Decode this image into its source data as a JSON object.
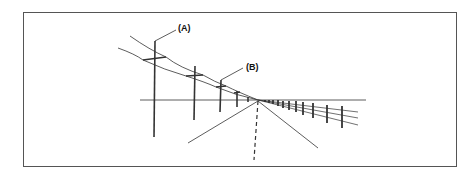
{
  "figure": {
    "labels": {
      "a": "(A)",
      "b": "(B)"
    },
    "colors": {
      "line": "#333333",
      "frame": "#555555",
      "background": "#ffffff"
    }
  }
}
